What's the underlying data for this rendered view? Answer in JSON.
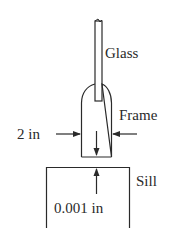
{
  "diagram": {
    "labels": {
      "glass": "Glass",
      "frame": "Frame",
      "width": "2 in",
      "sill": "Sill",
      "gap": "0.001 in"
    },
    "colors": {
      "stroke": "#2a2a2a",
      "background": "#ffffff"
    }
  }
}
